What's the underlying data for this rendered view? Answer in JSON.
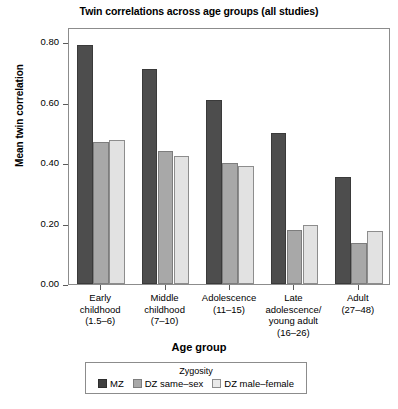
{
  "chart_data": {
    "type": "bar",
    "title": "Twin correlations across age groups (all studies)",
    "xlabel": "Age group",
    "ylabel": "Mean twin correlation",
    "ylim": [
      0.0,
      0.85
    ],
    "ytick_values": [
      0.0,
      0.2,
      0.4,
      0.6,
      0.8
    ],
    "ytick_labels": [
      "0.00",
      "0.20",
      "0.40",
      "0.60",
      "0.80"
    ],
    "grid": false,
    "legend_position": "bottom-outside",
    "legend_title": "Zygosity",
    "categories": [
      "Early\nchildhood\n(1.5–6)",
      "Middle\nchildhood\n(7–10)",
      "Adolescence\n(11–15)",
      "Late\nadolescence/\nyoung adult\n(16–26)",
      "Adult\n(27–48)"
    ],
    "series": [
      {
        "name": "MZ",
        "color": "#4d4d4d",
        "values": [
          0.79,
          0.71,
          0.61,
          0.5,
          0.355
        ]
      },
      {
        "name": "DZ same–sex",
        "color": "#a8a8a8",
        "values": [
          0.47,
          0.44,
          0.4,
          0.18,
          0.135
        ]
      },
      {
        "name": "DZ male–female",
        "color": "#e2e2e2",
        "values": [
          0.475,
          0.425,
          0.39,
          0.195,
          0.175
        ]
      }
    ]
  },
  "axes": {
    "y_title": "Mean twin correlation",
    "x_title": "Age group"
  },
  "legend": {
    "title": "Zygosity",
    "entries": [
      {
        "label": "MZ",
        "swatch": "mz"
      },
      {
        "label": "DZ same–sex",
        "swatch": "dzs"
      },
      {
        "label": "DZ male–female",
        "swatch": "dzmf"
      }
    ]
  },
  "colors": {
    "mz": "#4d4d4d",
    "dz_same_sex": "#a8a8a8",
    "dz_male_female": "#e2e2e2",
    "frame": "#8c8c8c",
    "background": "#ffffff"
  }
}
